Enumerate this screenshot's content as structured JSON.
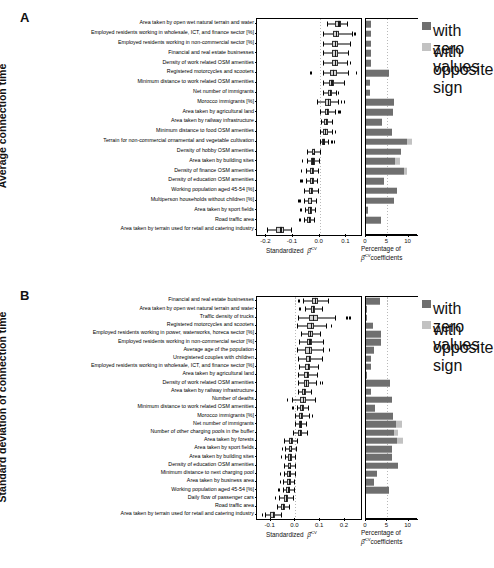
{
  "figure": {
    "panels": [
      {
        "letter": "A",
        "y_axis_title": "Average connection time",
        "x_axis_label_prefix": "Standardized",
        "x_axis_label_symbol": "β̂",
        "x_axis_label_sup": "CV",
        "right_axis_label_line1": "Percentage of",
        "right_axis_label_line2_sup": "CV",
        "right_axis_label_line2": "coefficients",
        "legend": [
          {
            "label": "with\nzero\nvalues",
            "color": "#6f6f6f",
            "name": "zero-values"
          },
          {
            "label": "with\nopposite\nsign",
            "color": "#c2c2c2",
            "name": "opposite-sign"
          }
        ]
      },
      {
        "letter": "B",
        "y_axis_title": "Standard deviation of connection time",
        "x_axis_label_prefix": "Standardized",
        "x_axis_label_symbol": "β̂",
        "x_axis_label_sup": "CV",
        "right_axis_label_line1": "Percentage of",
        "right_axis_label_line2_sup": "CV",
        "right_axis_label_line2": "coefficients",
        "legend": [
          {
            "label": "with\nzero\nvalues",
            "color": "#6f6f6f",
            "name": "zero-values"
          },
          {
            "label": "with\nopposite\nsign",
            "color": "#c2c2c2",
            "name": "opposite-sign"
          }
        ]
      }
    ]
  },
  "chart_data": [
    {
      "type": "box",
      "panel": "A",
      "title": "Average connection time",
      "xlabel": "Standardized beta-hat CV",
      "xlim": [
        -0.235,
        0.155
      ],
      "xticks": [
        -0.2,
        -0.1,
        0.0,
        0.1
      ],
      "xticklabels": [
        "-0.2",
        "-0.1",
        "0.0",
        "0.1"
      ],
      "grid": true,
      "gridlines": [
        0.0
      ],
      "right_panel": {
        "xlabel": "Percentage of beta-hat CV coefficients",
        "xlim": [
          0,
          12.2
        ],
        "xticks": [
          0,
          5,
          10
        ],
        "xticklabels": [
          "0",
          "5",
          "10"
        ],
        "gridlines": [
          5
        ]
      },
      "categories": [
        "Area taken by open wet natural terrain and water",
        "Employed residents working in wholesale, ICT, and finance sector [%]",
        "Employed residents working in non-commercial sector [%]",
        "Financial and real estate businesses",
        "Density of work related OSM amenities",
        "Registered motorcycles and scooters",
        "Minimum distance to work related OSM amenities",
        "Net number of immigrants",
        "Morocco immigrants [%]",
        "Area taken by agricultural land",
        "Area taken by railway infrastructure",
        "Minimum distance to food OSM amenities",
        "Terrain for non-commercial ornamental and vegetable cultivation",
        "Density of hobby OSM amenities",
        "Area taken by building sites",
        "Density of finance OSM amenities",
        "Density of education OSM amenities",
        "Working population aged 45-54 [%]",
        "Multiperson households without children [%]",
        "Area taken by sport fields",
        "Road traffic area",
        "Area taken by terrain used for retail and catering industry"
      ],
      "boxes": [
        {
          "whisker_low": 0.029,
          "q1": 0.059,
          "median": 0.07,
          "q3": 0.079,
          "whisker_high": 0.104,
          "outliers": []
        },
        {
          "whisker_low": 0.012,
          "q1": 0.05,
          "median": 0.061,
          "q3": 0.073,
          "whisker_high": 0.122,
          "outliers": [
            0.13
          ]
        },
        {
          "whisker_low": 0.011,
          "q1": 0.045,
          "median": 0.056,
          "q3": 0.069,
          "whisker_high": 0.114,
          "outliers": []
        },
        {
          "whisker_low": 0.012,
          "q1": 0.046,
          "median": 0.057,
          "q3": 0.068,
          "whisker_high": 0.108,
          "outliers": []
        },
        {
          "whisker_low": 0.012,
          "q1": 0.046,
          "median": 0.056,
          "q3": 0.068,
          "whisker_high": 0.102,
          "outliers": [
            0.113
          ]
        },
        {
          "whisker_low": 0.013,
          "q1": 0.038,
          "median": 0.05,
          "q3": 0.066,
          "whisker_high": 0.106,
          "outliers": [
            -0.035,
            0.135
          ]
        },
        {
          "whisker_low": 0.012,
          "q1": 0.036,
          "median": 0.044,
          "q3": 0.055,
          "whisker_high": 0.092,
          "outliers": []
        },
        {
          "whisker_low": 0.012,
          "q1": 0.031,
          "median": 0.038,
          "q3": 0.047,
          "whisker_high": 0.06,
          "outliers": [
            0.069
          ]
        },
        {
          "whisker_low": -0.01,
          "q1": 0.02,
          "median": 0.03,
          "q3": 0.043,
          "whisker_high": 0.07,
          "outliers": [
            0.08,
            0.09
          ]
        },
        {
          "whisker_low": 0.0,
          "q1": 0.02,
          "median": 0.027,
          "q3": 0.036,
          "whisker_high": 0.058,
          "outliers": [
            0.067,
            0.074
          ]
        },
        {
          "whisker_low": 0.004,
          "q1": 0.018,
          "median": 0.024,
          "q3": 0.031,
          "whisker_high": 0.048,
          "outliers": []
        },
        {
          "whisker_low": 0.0,
          "q1": 0.014,
          "median": 0.021,
          "q3": 0.03,
          "whisker_high": 0.045,
          "outliers": [
            0.057
          ]
        },
        {
          "whisker_low": 0.002,
          "q1": 0.01,
          "median": 0.014,
          "q3": 0.021,
          "whisker_high": 0.033,
          "outliers": [
            0.044,
            0.053
          ]
        },
        {
          "whisker_low": -0.048,
          "q1": -0.03,
          "median": -0.023,
          "q3": -0.016,
          "whisker_high": 0.0,
          "outliers": []
        },
        {
          "whisker_low": -0.048,
          "q1": -0.034,
          "median": -0.027,
          "q3": -0.018,
          "whisker_high": -0.002,
          "outliers": [
            -0.066
          ]
        },
        {
          "whisker_low": -0.05,
          "q1": -0.035,
          "median": -0.029,
          "q3": -0.022,
          "whisker_high": -0.006,
          "outliers": [
            -0.071
          ]
        },
        {
          "whisker_low": -0.05,
          "q1": -0.035,
          "median": -0.029,
          "q3": -0.023,
          "whisker_high": -0.01,
          "outliers": [
            -0.073,
            -0.068
          ]
        },
        {
          "whisker_low": -0.058,
          "q1": -0.041,
          "median": -0.033,
          "q3": -0.025,
          "whisker_high": -0.008,
          "outliers": []
        },
        {
          "whisker_low": -0.06,
          "q1": -0.042,
          "median": -0.034,
          "q3": -0.027,
          "whisker_high": -0.012,
          "outliers": [
            -0.083,
            -0.077
          ]
        },
        {
          "whisker_low": -0.054,
          "q1": -0.042,
          "median": -0.036,
          "q3": -0.03,
          "whisker_high": -0.018,
          "outliers": [
            -0.072
          ]
        },
        {
          "whisker_low": -0.058,
          "q1": -0.046,
          "median": -0.04,
          "q3": -0.033,
          "whisker_high": -0.02,
          "outliers": [
            -0.076
          ]
        },
        {
          "whisker_low": -0.196,
          "q1": -0.162,
          "median": -0.147,
          "q3": -0.134,
          "whisker_high": -0.108,
          "outliers": []
        }
      ],
      "bars": [
        {
          "zero": 1.1,
          "opposite": 0.0
        },
        {
          "zero": 1.1,
          "opposite": 0.0
        },
        {
          "zero": 1.1,
          "opposite": 0.0
        },
        {
          "zero": 1.1,
          "opposite": 0.0
        },
        {
          "zero": 1.1,
          "opposite": 0.0
        },
        {
          "zero": 5.3,
          "opposite": 0.0
        },
        {
          "zero": 0.9,
          "opposite": 0.0
        },
        {
          "zero": 0.9,
          "opposite": 0.0
        },
        {
          "zero": 6.6,
          "opposite": 0.0
        },
        {
          "zero": 6.4,
          "opposite": 0.0
        },
        {
          "zero": 3.8,
          "opposite": 0.0
        },
        {
          "zero": 6.2,
          "opposite": 0.0
        },
        {
          "zero": 9.6,
          "opposite": 1.3
        },
        {
          "zero": 8.2,
          "opposite": 0.0
        },
        {
          "zero": 6.8,
          "opposite": 1.1
        },
        {
          "zero": 9.0,
          "opposite": 0.6
        },
        {
          "zero": 4.2,
          "opposite": 0.0
        },
        {
          "zero": 7.2,
          "opposite": 0.0
        },
        {
          "zero": 6.6,
          "opposite": 0.0
        },
        {
          "zero": 0.4,
          "opposite": 0.0
        },
        {
          "zero": 3.6,
          "opposite": 0.0
        },
        {
          "zero": 0.0,
          "opposite": 0.0
        }
      ]
    },
    {
      "type": "box",
      "panel": "B",
      "title": "Standard deviation of connection time",
      "xlabel": "Standardized beta-hat CV",
      "xlim": [
        -0.155,
        0.265
      ],
      "xticks": [
        -0.1,
        0.0,
        0.1,
        0.2
      ],
      "xticklabels": [
        "-0.1",
        "0.0",
        "0.1",
        "0.2"
      ],
      "grid": true,
      "gridlines": [
        0.0
      ],
      "right_panel": {
        "xlabel": "Percentage of beta-hat CV coefficients",
        "xlim": [
          0,
          12.2
        ],
        "xticks": [
          0,
          5,
          10
        ],
        "xticklabels": [
          "0",
          "5",
          "10"
        ],
        "gridlines": [
          5
        ]
      },
      "categories": [
        "Financial and real estate businesses",
        "Area taken by open wet natural terrain and water",
        "Traffic density of trucks",
        "Registered motorcycles and scooters",
        "Employed residents working in power, waterworks, horeca sector [%]",
        "Employed residents working in non-commercial sector [%]",
        "Average age of the population",
        "Unregistered couples with children",
        "Employed residents working in wholesale, ICT, and finance sector [%]",
        "Area taken by agricultural land",
        "Density of work related OSM amenities",
        "Area taken by railway infrastructure",
        "Number of deaths",
        "Minimum distance to work related OSM amenities",
        "Morocco immigrants [%]",
        "Net number of immigrants",
        "Number of other charging pools in the buffer",
        "Area taken by forests",
        "Area taken by sport fields",
        "Area taken by building sites",
        "Density of education OSM amenities",
        "Minimum distance to next charging pool",
        "Area taken by business area",
        "Working population aged 45-54 [%]",
        "Daily flow of passenger cars",
        "Road traffic area",
        "Area taken by terrain used for retail and catering industry"
      ],
      "boxes": [
        {
          "whisker_low": 0.03,
          "q1": 0.066,
          "median": 0.079,
          "q3": 0.092,
          "whisker_high": 0.13,
          "outliers": [
            0.012
          ]
        },
        {
          "whisker_low": 0.038,
          "q1": 0.062,
          "median": 0.07,
          "q3": 0.08,
          "whisker_high": 0.107,
          "outliers": [
            0.016
          ]
        },
        {
          "whisker_low": 0.01,
          "q1": 0.056,
          "median": 0.072,
          "q3": 0.09,
          "whisker_high": 0.16,
          "outliers": [
            0.205,
            0.218
          ]
        },
        {
          "whisker_low": 0.006,
          "q1": 0.048,
          "median": 0.062,
          "q3": 0.077,
          "whisker_high": 0.124,
          "outliers": [
            0.142
          ]
        },
        {
          "whisker_low": 0.024,
          "q1": 0.05,
          "median": 0.06,
          "q3": 0.072,
          "whisker_high": 0.1,
          "outliers": []
        },
        {
          "whisker_low": 0.016,
          "q1": 0.046,
          "median": 0.057,
          "q3": 0.069,
          "whisker_high": 0.112,
          "outliers": []
        },
        {
          "whisker_low": 0.006,
          "q1": 0.04,
          "median": 0.053,
          "q3": 0.067,
          "whisker_high": 0.112,
          "outliers": [
            0.134
          ]
        },
        {
          "whisker_low": 0.012,
          "q1": 0.042,
          "median": 0.053,
          "q3": 0.065,
          "whisker_high": 0.108,
          "outliers": []
        },
        {
          "whisker_low": 0.016,
          "q1": 0.04,
          "median": 0.05,
          "q3": 0.061,
          "whisker_high": 0.092,
          "outliers": []
        },
        {
          "whisker_low": 0.012,
          "q1": 0.036,
          "median": 0.046,
          "q3": 0.057,
          "whisker_high": 0.088,
          "outliers": []
        },
        {
          "whisker_low": 0.01,
          "q1": 0.034,
          "median": 0.043,
          "q3": 0.054,
          "whisker_high": 0.084,
          "outliers": [
            0.098,
            0.106
          ]
        },
        {
          "whisker_low": 0.012,
          "q1": 0.028,
          "median": 0.035,
          "q3": 0.043,
          "whisker_high": 0.064,
          "outliers": []
        },
        {
          "whisker_low": -0.012,
          "q1": 0.02,
          "median": 0.031,
          "q3": 0.044,
          "whisker_high": 0.08,
          "outliers": [
            -0.035
          ]
        },
        {
          "whisker_low": 0.006,
          "q1": 0.02,
          "median": 0.027,
          "q3": 0.034,
          "whisker_high": 0.05,
          "outliers": [
            -0.012
          ]
        },
        {
          "whisker_low": -0.002,
          "q1": 0.014,
          "median": 0.022,
          "q3": 0.031,
          "whisker_high": 0.054,
          "outliers": [
            0.066
          ]
        },
        {
          "whisker_low": 0.0,
          "q1": 0.014,
          "median": 0.02,
          "q3": 0.027,
          "whisker_high": 0.042,
          "outliers": []
        },
        {
          "whisker_low": -0.01,
          "q1": 0.01,
          "median": 0.018,
          "q3": 0.027,
          "whisker_high": 0.046,
          "outliers": []
        },
        {
          "whisker_low": -0.046,
          "q1": -0.026,
          "median": -0.018,
          "q3": -0.01,
          "whisker_high": 0.008,
          "outliers": []
        },
        {
          "whisker_low": -0.04,
          "q1": -0.026,
          "median": -0.019,
          "q3": -0.012,
          "whisker_high": 0.002,
          "outliers": [
            -0.056
          ]
        },
        {
          "whisker_low": -0.042,
          "q1": -0.028,
          "median": -0.021,
          "q3": -0.014,
          "whisker_high": 0.0,
          "outliers": [
            -0.058
          ]
        },
        {
          "whisker_low": -0.044,
          "q1": -0.03,
          "median": -0.023,
          "q3": -0.016,
          "whisker_high": -0.002,
          "outliers": []
        },
        {
          "whisker_low": -0.046,
          "q1": -0.032,
          "median": -0.024,
          "q3": -0.017,
          "whisker_high": -0.002,
          "outliers": [
            -0.062
          ]
        },
        {
          "whisker_low": -0.05,
          "q1": -0.034,
          "median": -0.026,
          "q3": -0.019,
          "whisker_high": -0.004,
          "outliers": [
            -0.064
          ]
        },
        {
          "whisker_low": -0.052,
          "q1": -0.036,
          "median": -0.028,
          "q3": -0.02,
          "whisker_high": -0.004,
          "outliers": [
            -0.07,
            -0.066
          ]
        },
        {
          "whisker_low": -0.066,
          "q1": -0.046,
          "median": -0.037,
          "q3": -0.028,
          "whisker_high": -0.008,
          "outliers": [
            -0.082
          ]
        },
        {
          "whisker_low": -0.074,
          "q1": -0.058,
          "median": -0.05,
          "q3": -0.042,
          "whisker_high": -0.026,
          "outliers": []
        },
        {
          "whisker_low": -0.124,
          "q1": -0.102,
          "median": -0.092,
          "q3": -0.082,
          "whisker_high": -0.06,
          "outliers": [
            -0.136
          ]
        }
      ],
      "bars": [
        {
          "zero": 3.4,
          "opposite": 0.0
        },
        {
          "zero": 0.3,
          "opposite": 0.0
        },
        {
          "zero": 0.3,
          "opposite": 0.0
        },
        {
          "zero": 1.7,
          "opposite": 0.0
        },
        {
          "zero": 3.6,
          "opposite": 0.0
        },
        {
          "zero": 3.6,
          "opposite": 0.0
        },
        {
          "zero": 1.9,
          "opposite": 0.0
        },
        {
          "zero": 1.1,
          "opposite": 0.0
        },
        {
          "zero": 1.1,
          "opposite": 0.0
        },
        {
          "zero": 0.3,
          "opposite": 0.0
        },
        {
          "zero": 5.6,
          "opposite": 0.0
        },
        {
          "zero": 1.1,
          "opposite": 0.0
        },
        {
          "zero": 6.0,
          "opposite": 0.0
        },
        {
          "zero": 2.0,
          "opposite": 0.0
        },
        {
          "zero": 6.4,
          "opposite": 0.0
        },
        {
          "zero": 7.0,
          "opposite": 1.4
        },
        {
          "zero": 6.6,
          "opposite": 0.8
        },
        {
          "zero": 7.2,
          "opposite": 1.6
        },
        {
          "zero": 6.2,
          "opposite": 0.0
        },
        {
          "zero": 6.0,
          "opposite": 0.0
        },
        {
          "zero": 7.6,
          "opposite": 0.0
        },
        {
          "zero": 2.6,
          "opposite": 0.0
        },
        {
          "zero": 1.9,
          "opposite": 0.0
        },
        {
          "zero": 5.4,
          "opposite": 0.0
        },
        {
          "zero": 0.0,
          "opposite": 0.0
        },
        {
          "zero": 0.0,
          "opposite": 0.0
        },
        {
          "zero": 0.0,
          "opposite": 0.0
        }
      ]
    }
  ]
}
